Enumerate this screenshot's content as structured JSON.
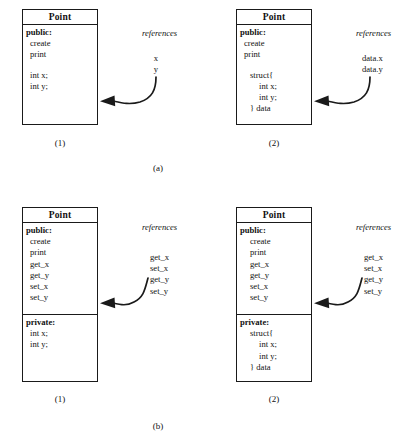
{
  "figure": {
    "group_labels": [
      {
        "id": "group-a",
        "text": "(a)"
      },
      {
        "id": "group-b",
        "text": "(b)"
      }
    ]
  },
  "panels": {
    "a1": {
      "panel_label": "(1)",
      "references_label": "references",
      "class_name": "Point",
      "compartments": [
        {
          "rows": [
            {
              "text": "public:",
              "style": "access"
            },
            {
              "text": "create",
              "style": "lvl1"
            },
            {
              "text": "print",
              "style": "lvl1"
            },
            {
              "text": "",
              "style": "spacer"
            },
            {
              "text": "int x;",
              "style": "lvl1"
            },
            {
              "text": "int y;",
              "style": "lvl1"
            }
          ]
        }
      ],
      "references": [
        "x",
        "y"
      ]
    },
    "a2": {
      "panel_label": "(2)",
      "references_label": "references",
      "class_name": "Point",
      "compartments": [
        {
          "rows": [
            {
              "text": "public:",
              "style": "access"
            },
            {
              "text": "create",
              "style": "lvl1"
            },
            {
              "text": "print",
              "style": "lvl1"
            },
            {
              "text": "",
              "style": "spacer"
            },
            {
              "text": "struct{",
              "style": "lvl2"
            },
            {
              "text": "int x;",
              "style": "lvl3"
            },
            {
              "text": "int y;",
              "style": "lvl3"
            },
            {
              "text": "} data",
              "style": "lvl2"
            }
          ]
        }
      ],
      "references": [
        "data.x",
        "data.y"
      ]
    },
    "b1": {
      "panel_label": "(1)",
      "references_label": "references",
      "class_name": "Point",
      "compartments": [
        {
          "rows": [
            {
              "text": "public:",
              "style": "access"
            },
            {
              "text": "create",
              "style": "lvl1"
            },
            {
              "text": "print",
              "style": "lvl1"
            },
            {
              "text": "get_x",
              "style": "lvl1"
            },
            {
              "text": "get_y",
              "style": "lvl1"
            },
            {
              "text": "set_x",
              "style": "lvl1"
            },
            {
              "text": "set_y",
              "style": "lvl1"
            }
          ]
        },
        {
          "rows": [
            {
              "text": "private:",
              "style": "access"
            },
            {
              "text": "int x;",
              "style": "lvl1"
            },
            {
              "text": "int y;",
              "style": "lvl1"
            }
          ]
        }
      ],
      "references": [
        "get_x",
        "set_x",
        "get_y",
        "set_y"
      ]
    },
    "b2": {
      "panel_label": "(2)",
      "references_label": "references",
      "class_name": "Point",
      "compartments": [
        {
          "rows": [
            {
              "text": "public:",
              "style": "access"
            },
            {
              "text": "create",
              "style": "lvl2"
            },
            {
              "text": "print",
              "style": "lvl2"
            },
            {
              "text": "get_x",
              "style": "lvl2"
            },
            {
              "text": "get_y",
              "style": "lvl2"
            },
            {
              "text": "set_x",
              "style": "lvl2"
            },
            {
              "text": "set_y",
              "style": "lvl2"
            }
          ]
        },
        {
          "rows": [
            {
              "text": "private:",
              "style": "access"
            },
            {
              "text": "struct{",
              "style": "lvl2"
            },
            {
              "text": "int x;",
              "style": "lvl3"
            },
            {
              "text": "int y;",
              "style": "lvl3"
            },
            {
              "text": "} data",
              "style": "lvl2"
            }
          ]
        }
      ],
      "references": [
        "get_x",
        "set_x",
        "get_y",
        "set_y"
      ]
    }
  },
  "colors": {
    "ink": "#1a1a1a",
    "paper": "#ffffff"
  }
}
